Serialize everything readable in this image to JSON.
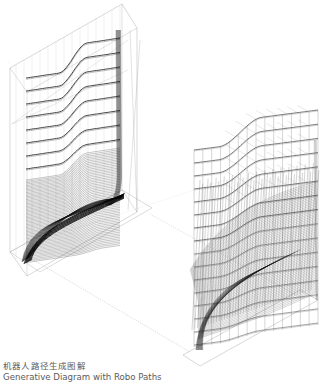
{
  "caption": {
    "title_zh": "机器人路径生成图解",
    "title_en": "Generative Diagram with Robo Paths"
  },
  "figures": [
    {
      "name": "dense-path-volume",
      "description": "Left isometric box with dense toolpath curves forming an S-shaped surface",
      "axis_ticks": [
        "z",
        "z",
        "z",
        "x",
        "x",
        "y"
      ]
    },
    {
      "name": "robot-path-lattice",
      "description": "Right isometric lattice of robot paths with orientation vectors on a base plate"
    }
  ],
  "colors": {
    "background": "#ffffff",
    "stroke_dark": "#111111",
    "stroke_mid": "#555555",
    "stroke_light": "#b0b0b0",
    "caption_text": "#5a5a5a"
  }
}
